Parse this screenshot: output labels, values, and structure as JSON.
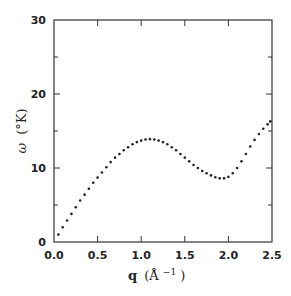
{
  "chart_data": {
    "type": "scatter",
    "title": "",
    "xlabel": "q (Å⁻¹)",
    "ylabel": "ω (°K)",
    "xlim": [
      0,
      2.5
    ],
    "ylim": [
      0,
      30
    ],
    "xticks": [
      0.0,
      0.5,
      1.0,
      1.5,
      2.0,
      2.5
    ],
    "xtick_labels": [
      "0.0",
      "0.5",
      "1.0",
      "1.5",
      "2.0",
      "2.5"
    ],
    "yticks": [
      0,
      10,
      20,
      30
    ],
    "ytick_labels": [
      "0",
      "10",
      "20",
      "30"
    ],
    "y_minor_ticks": [
      5,
      15,
      25
    ],
    "grid": false,
    "legend": null,
    "series": [
      {
        "name": "dispersion",
        "marker": "dot",
        "color": "#222222",
        "x": [
          0.05,
          0.1,
          0.15,
          0.2,
          0.25,
          0.3,
          0.35,
          0.4,
          0.45,
          0.5,
          0.55,
          0.6,
          0.65,
          0.7,
          0.75,
          0.8,
          0.85,
          0.9,
          0.95,
          1.0,
          1.05,
          1.1,
          1.15,
          1.2,
          1.25,
          1.3,
          1.35,
          1.4,
          1.45,
          1.5,
          1.55,
          1.6,
          1.65,
          1.7,
          1.75,
          1.8,
          1.85,
          1.9,
          1.95,
          2.0,
          2.05,
          2.1,
          2.15,
          2.2,
          2.25,
          2.3,
          2.35,
          2.4,
          2.45,
          2.48
        ],
        "y": [
          1.0,
          2.0,
          2.9,
          3.8,
          4.7,
          5.6,
          6.4,
          7.2,
          8.0,
          8.7,
          9.4,
          10.1,
          10.8,
          11.4,
          11.9,
          12.4,
          12.8,
          13.2,
          13.5,
          13.7,
          13.85,
          13.9,
          13.85,
          13.7,
          13.5,
          13.2,
          12.8,
          12.4,
          11.9,
          11.4,
          10.9,
          10.4,
          10.0,
          9.6,
          9.3,
          9.0,
          8.75,
          8.6,
          8.6,
          8.8,
          9.3,
          10.0,
          10.9,
          11.9,
          12.9,
          13.8,
          14.6,
          15.3,
          15.9,
          16.3
        ]
      }
    ]
  },
  "labels": {
    "xlabel_main": "q",
    "xlabel_unit": "(Å",
    "xlabel_exp": "−1",
    "xlabel_close": ")",
    "ylabel_main": "ω",
    "ylabel_unit": "(°K)"
  }
}
